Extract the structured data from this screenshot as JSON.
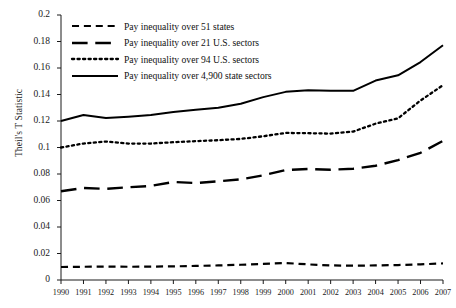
{
  "chart_data": {
    "type": "line",
    "title": "",
    "xlabel": "",
    "ylabel": "Theil's T Statistic",
    "ylim": [
      0,
      0.2
    ],
    "ytick_step": 0.02,
    "grid": false,
    "legend_position": "top-left",
    "x": [
      1990,
      1991,
      1992,
      1993,
      1994,
      1995,
      1996,
      1997,
      1998,
      1999,
      2000,
      2001,
      2002,
      2003,
      2004,
      2005,
      2006,
      2007
    ],
    "xticks": [
      "1990",
      "1991",
      "1992",
      "1993",
      "1994",
      "1995",
      "1996",
      "1997",
      "1998",
      "1999",
      "2000",
      "2001",
      "2002",
      "2003",
      "2004",
      "2005",
      "2006",
      "2007"
    ],
    "yticks": [
      "0",
      "0.02",
      "0.04",
      "0.06",
      "0.08",
      "0.1",
      "0.12",
      "0.14",
      "0.16",
      "0.18",
      "0.2"
    ],
    "ytick_values": [
      0,
      0.02,
      0.04,
      0.06,
      0.08,
      0.1,
      0.12,
      0.14,
      0.16,
      0.18,
      0.2
    ],
    "series": [
      {
        "name": "Pay inequality over 51 states",
        "style": "dashed",
        "color": "#000000",
        "values": [
          0.0098,
          0.01,
          0.0101,
          0.01,
          0.0101,
          0.0103,
          0.0106,
          0.011,
          0.0115,
          0.0122,
          0.0128,
          0.0118,
          0.011,
          0.0108,
          0.011,
          0.0113,
          0.0118,
          0.0125
        ]
      },
      {
        "name": "Pay inequality over 21 U.S. sectors",
        "style": "long-dashed",
        "color": "#000000",
        "values": [
          0.067,
          0.0695,
          0.0688,
          0.07,
          0.071,
          0.074,
          0.0732,
          0.0745,
          0.076,
          0.079,
          0.083,
          0.0838,
          0.0832,
          0.084,
          0.0862,
          0.0905,
          0.096,
          0.105
        ]
      },
      {
        "name": "Pay inequality over 94 U.S. sectors",
        "style": "dotted",
        "color": "#000000",
        "values": [
          0.1,
          0.103,
          0.1045,
          0.103,
          0.103,
          0.104,
          0.1048,
          0.1055,
          0.1065,
          0.1085,
          0.111,
          0.1108,
          0.1105,
          0.112,
          0.118,
          0.122,
          0.1355,
          0.147
        ]
      },
      {
        "name": "Pay inequality over 4,900 state sectors",
        "style": "solid",
        "color": "#000000",
        "values": [
          0.12,
          0.1245,
          0.1222,
          0.1232,
          0.1245,
          0.1268,
          0.1285,
          0.13,
          0.133,
          0.138,
          0.142,
          0.1432,
          0.1428,
          0.1428,
          0.1505,
          0.1545,
          0.1645,
          0.1772
        ]
      }
    ]
  }
}
